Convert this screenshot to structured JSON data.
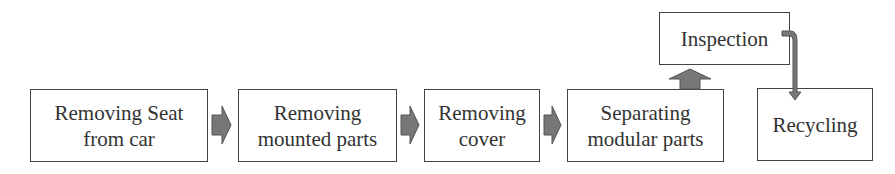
{
  "diagram": {
    "type": "process-flow",
    "nodes": [
      {
        "id": "remove-seat",
        "label": "Removing Seat\nfrom car"
      },
      {
        "id": "remove-mounted",
        "label": "Removing\nmounted parts"
      },
      {
        "id": "remove-cover",
        "label": "Removing\ncover"
      },
      {
        "id": "separate-modular",
        "label": "Separating\nmodular parts"
      },
      {
        "id": "inspection",
        "label": "Inspection"
      },
      {
        "id": "recycling",
        "label": "Recycling"
      }
    ],
    "edges": [
      {
        "from": "remove-seat",
        "to": "remove-mounted"
      },
      {
        "from": "remove-mounted",
        "to": "remove-cover"
      },
      {
        "from": "remove-cover",
        "to": "separate-modular"
      },
      {
        "from": "separate-modular",
        "to": "inspection"
      },
      {
        "from": "inspection",
        "to": "recycling"
      }
    ],
    "colors": {
      "arrow_fill": "#777777",
      "border": "#444444",
      "text": "#333333"
    }
  }
}
